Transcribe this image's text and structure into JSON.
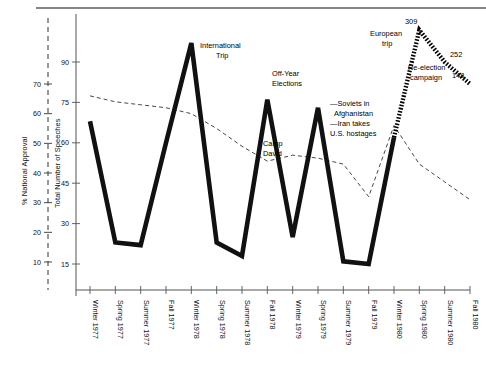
{
  "figure": {
    "top_rule": true,
    "background": "#ffffff",
    "speech_line_color": "#111111",
    "approval_line_color": "#333333",
    "highlight_line_color": "#000000"
  },
  "axes": {
    "left": {
      "title": "% National Approval",
      "style": "dashed",
      "ticks": [
        10,
        20,
        30,
        40,
        50,
        60,
        70
      ],
      "tick_labels": [
        "10",
        "20",
        "30",
        "40",
        "50",
        "60",
        "70"
      ],
      "min": 5,
      "max": 78
    },
    "right_of_left": {
      "title": "Total Number of Speeches",
      "style": "solid",
      "ticks": [
        15,
        30,
        45,
        60,
        75,
        90
      ],
      "tick_labels": [
        "15",
        "30",
        "45",
        "60",
        "75",
        "90"
      ],
      "min": 0,
      "max": 100
    },
    "x": {
      "categories": [
        "Winter 1977",
        "Spring 1977",
        "Summer 1977",
        "Fall 1977",
        "Winter 1978",
        "Spring 1978",
        "Summer 1978",
        "Fall 1978",
        "Winter 1979",
        "Spring 1979",
        "Summer 1979",
        "Fall 1979",
        "Winter 1980",
        "Spring 1980",
        "Summer 1980",
        "Fall 1980"
      ]
    }
  },
  "chart_data": {
    "type": "line",
    "title": "",
    "xlabel": "",
    "ylabel": "Total Number of Speeches",
    "ylim": [
      0,
      100
    ],
    "grid": false,
    "legend": "none",
    "categories": [
      "Winter 1977",
      "Spring 1977",
      "Summer 1977",
      "Fall 1977",
      "Winter 1978",
      "Spring 1978",
      "Summer 1978",
      "Fall 1978",
      "Winter 1979",
      "Spring 1979",
      "Summer 1979",
      "Fall 1979",
      "Winter 1980",
      "Spring 1980",
      "Summer 1980",
      "Fall 1980"
    ],
    "series": [
      {
        "name": "Total Number of Speeches",
        "axis": "right_of_left",
        "style": "thick-solid",
        "values": [
          68,
          23,
          22,
          60,
          97,
          23,
          18,
          76,
          25,
          73,
          16,
          15,
          62,
          309,
          252,
          148
        ]
      },
      {
        "name": "% National Approval",
        "axis": "left",
        "style": "dashed",
        "values": [
          66,
          64,
          63,
          62,
          60,
          55,
          49,
          44,
          46,
          45,
          43,
          32,
          56,
          43,
          37,
          31
        ]
      }
    ],
    "highlight_segment": {
      "name": "Re-election campaign surge",
      "style": "dotted-thick",
      "from_category": "Winter 1980",
      "points": [
        {
          "category": "Winter 1980",
          "value": 62
        },
        {
          "category": "Spring 1980",
          "value": 309
        },
        {
          "category": "Summer 1980",
          "value": 252
        },
        {
          "category": "Fall 1980",
          "value": 148
        }
      ],
      "value_labels": [
        "309",
        "252",
        "148"
      ]
    },
    "annotations": [
      {
        "id": "international-trip",
        "text": "International\nTrip",
        "category": "Winter 1978"
      },
      {
        "id": "off-year-elections",
        "text": "Off-Year\nElections",
        "category": "Fall 1978"
      },
      {
        "id": "camp-david",
        "text": "Camp\nDavid",
        "category": "Summer 1978"
      },
      {
        "id": "soviets-iran",
        "text": "—Soviets in\nAfghanistan\n—Iran takes\nU.S. hostages",
        "category": "Fall 1979"
      },
      {
        "id": "european-trip",
        "text": "European\ntrip",
        "category": "Spring 1980"
      },
      {
        "id": "re-election-campaign",
        "text": "Re-election\ncampaign",
        "category": "Spring 1980"
      }
    ]
  },
  "annotation_text": {
    "international_trip_l1": "International",
    "international_trip_l2": "Trip",
    "off_year_l1": "Off-Year",
    "off_year_l2": "Elections",
    "camp_david_l1": "Camp",
    "camp_david_l2": "David",
    "soviets_l1": "—Soviets in",
    "soviets_l2": "Afghanistan",
    "soviets_l3": "—Iran takes",
    "soviets_l4": "U.S. hostages",
    "european_l1": "European",
    "european_l2": "trip",
    "reelection_l1": "Re-election",
    "reelection_l2": "campaign",
    "val_309": "309",
    "val_252": "252",
    "val_148": "148"
  }
}
